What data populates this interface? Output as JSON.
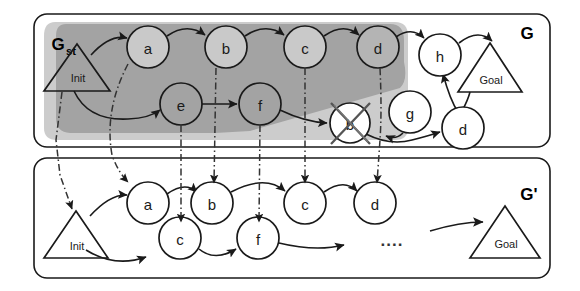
{
  "figure": {
    "background": "#ffffff",
    "stroke": "#1a1a1a",
    "shade_light": "#c9c9c9",
    "shade_dark": "#a3a3a3",
    "panel_fill": "#ffffff"
  },
  "panels": [
    {
      "id": "top",
      "label": "G",
      "sub_label_main": "G",
      "sub_label_sub": "st",
      "x": 34,
      "y": 14,
      "w": 516,
      "h": 133
    },
    {
      "id": "bottom",
      "label": "G'",
      "x": 34,
      "y": 158,
      "w": 516,
      "h": 120
    }
  ],
  "top_graph": {
    "start": {
      "name": "Init",
      "label": "Init",
      "cx": 77,
      "cy": 68
    },
    "goal": {
      "name": "Goal",
      "label": "Goal",
      "cx": 490,
      "cy": 67
    },
    "nodes": [
      {
        "id": "t-a",
        "label": "a",
        "cx": 148,
        "cy": 47,
        "shaded": true
      },
      {
        "id": "t-b",
        "label": "b",
        "cx": 226,
        "cy": 47,
        "shaded": true
      },
      {
        "id": "t-c",
        "label": "c",
        "cx": 305,
        "cy": 47,
        "shaded": true
      },
      {
        "id": "t-d",
        "label": "d",
        "cx": 378,
        "cy": 47,
        "shaded": true
      },
      {
        "id": "t-h",
        "label": "h",
        "cx": 440,
        "cy": 53,
        "shaded": false
      },
      {
        "id": "t-e",
        "label": "e",
        "cx": 181,
        "cy": 104,
        "shaded": true
      },
      {
        "id": "t-f",
        "label": "f",
        "cx": 260,
        "cy": 104,
        "shaded": true
      },
      {
        "id": "t-bx",
        "label": "b",
        "cx": 350,
        "cy": 123,
        "shaded": false,
        "crossed": true
      },
      {
        "id": "t-g",
        "label": "g",
        "cx": 410,
        "cy": 112,
        "shaded": false
      },
      {
        "id": "t-d2",
        "label": "d",
        "cx": 463,
        "cy": 129,
        "shaded": false
      }
    ]
  },
  "bottom_graph": {
    "start": {
      "name": "Init",
      "label": "Init",
      "cx": 75,
      "cy": 234
    },
    "goal": {
      "name": "Goal",
      "label": "Goal",
      "cx": 505,
      "cy": 234
    },
    "ellipsis": {
      "label": "....",
      "cx": 392,
      "cy": 237
    },
    "nodes": [
      {
        "id": "b-a",
        "label": "a",
        "cx": 148,
        "cy": 203
      },
      {
        "id": "b-b",
        "label": "b",
        "cx": 212,
        "cy": 203
      },
      {
        "id": "b-c",
        "label": "c",
        "cx": 305,
        "cy": 203
      },
      {
        "id": "b-d",
        "label": "d",
        "cx": 375,
        "cy": 203
      },
      {
        "id": "b-c2",
        "label": "c",
        "cx": 180,
        "cy": 238
      },
      {
        "id": "b-f",
        "label": "f",
        "cx": 258,
        "cy": 238
      }
    ]
  },
  "connectors": {
    "style": "dash-dot",
    "count": 6,
    "description": "vertical dash-dot mapping arrows from graph G to graph G-prime"
  }
}
